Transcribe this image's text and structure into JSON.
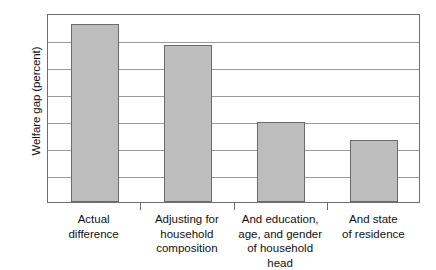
{
  "chart_data": {
    "type": "bar",
    "title": "",
    "xlabel": "",
    "ylabel": "Welfare gap (percent)",
    "ylim": [
      0,
      7
    ],
    "yticks": [
      0,
      1,
      2,
      3,
      4,
      5,
      6,
      7
    ],
    "ytick_labels": [
      "0",
      "1",
      "2",
      "3",
      "4",
      "5",
      "6",
      "7"
    ],
    "grid": true,
    "legend": "none",
    "bar_color": "#bdbdbd",
    "bar_edge_color": "#6b6b6b",
    "categories": [
      "Actual difference",
      "Adjusting for household composition",
      "And education, age, and gender of household head",
      "And state of residence"
    ],
    "category_lines": [
      [
        "Actual",
        "difference"
      ],
      [
        "Adjusting for",
        "household",
        "composition"
      ],
      [
        "And education,",
        "age, and gender",
        "of household head"
      ],
      [
        "And state",
        "of residence"
      ]
    ],
    "values": [
      6.6,
      5.8,
      2.95,
      2.3
    ]
  }
}
